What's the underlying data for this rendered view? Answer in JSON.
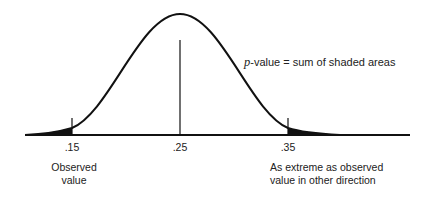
{
  "diagram": {
    "title": "",
    "annotation": {
      "p_symbol": "p",
      "rest": "-value = sum of shaded areas"
    },
    "ticks": [
      {
        "label": ".15",
        "role": "observed"
      },
      {
        "label": ".25",
        "role": "center"
      },
      {
        "label": ".35",
        "role": "mirror"
      }
    ],
    "captions": {
      "observed_line1": "Observed",
      "observed_line2": "value",
      "mirror_line1": "As extreme as observed",
      "mirror_line2": "value in other direction"
    },
    "colors": {
      "line": "#111111",
      "shade": "#111111",
      "background": "#ffffff"
    }
  }
}
